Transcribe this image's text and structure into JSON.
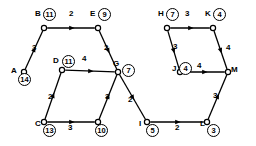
{
  "diagram": {
    "stroke_color": "#000000",
    "background": "#ffffff",
    "nodes": [
      {
        "id": "A",
        "letter": "A",
        "value": "14",
        "x": 24,
        "y": 72,
        "lx": 11,
        "ly": 67,
        "cx": 18,
        "cy": 73
      },
      {
        "id": "B",
        "letter": "B",
        "value": "11",
        "x": 44,
        "y": 28,
        "lx": 35,
        "ly": 10,
        "cx": 43,
        "cy": 8
      },
      {
        "id": "E",
        "letter": "E",
        "value": "9",
        "x": 98,
        "y": 28,
        "lx": 90,
        "ly": 10,
        "cx": 98,
        "cy": 8
      },
      {
        "id": "D",
        "letter": "D",
        "value": "11",
        "x": 62,
        "y": 70,
        "lx": 53,
        "ly": 57,
        "cx": 62,
        "cy": 55
      },
      {
        "id": "G",
        "letter": "G",
        "value": "7",
        "x": 118,
        "y": 72,
        "lx": 113,
        "ly": 60,
        "cx": 122,
        "cy": 64
      },
      {
        "id": "C",
        "letter": "C",
        "value": "13",
        "x": 44,
        "y": 122,
        "lx": 35,
        "ly": 120,
        "cx": 43,
        "cy": 124
      },
      {
        "id": "N10",
        "letter": "",
        "value": "10",
        "x": 98,
        "y": 122,
        "lx": 0,
        "ly": 0,
        "cx": 95,
        "cy": 124
      },
      {
        "id": "I",
        "letter": "I",
        "value": "5",
        "x": 147,
        "y": 122,
        "lx": 139,
        "ly": 120,
        "cx": 146,
        "cy": 124
      },
      {
        "id": "L",
        "letter": "L",
        "value": "3",
        "x": 207,
        "y": 122,
        "lx": 200,
        "ly": 120,
        "cx": 207,
        "cy": 124
      },
      {
        "id": "M",
        "letter": "M",
        "value": "",
        "x": 228,
        "y": 72,
        "lx": 231,
        "ly": 66,
        "cx": 0,
        "cy": 0
      },
      {
        "id": "H",
        "letter": "H",
        "value": "7",
        "x": 167,
        "y": 28,
        "lx": 158,
        "ly": 10,
        "cx": 166,
        "cy": 8
      },
      {
        "id": "K",
        "letter": "K",
        "value": "4",
        "x": 213,
        "y": 28,
        "lx": 205,
        "ly": 10,
        "cx": 213,
        "cy": 8
      },
      {
        "id": "J",
        "letter": "J",
        "value": "4",
        "x": 180,
        "y": 72,
        "lx": 172,
        "ly": 65,
        "cx": 179,
        "cy": 62
      }
    ],
    "edges": [
      {
        "from": "A",
        "to": "B",
        "weight": "3",
        "wx": 32,
        "wy": 44
      },
      {
        "from": "B",
        "to": "E",
        "weight": "2",
        "wx": 69,
        "wy": 10
      },
      {
        "from": "E",
        "to": "G",
        "weight": "2",
        "wx": 104,
        "wy": 44
      },
      {
        "from": "D",
        "to": "G",
        "weight": "4",
        "wx": 82,
        "wy": 55
      },
      {
        "from": "C",
        "to": "D",
        "weight": "2",
        "wx": 48,
        "wy": 93
      },
      {
        "from": "C",
        "to": "N10",
        "weight": "3",
        "wx": 68,
        "wy": 124
      },
      {
        "from": "N10",
        "to": "G",
        "weight": "3",
        "wx": 105,
        "wy": 93
      },
      {
        "from": "G",
        "to": "I",
        "weight": "2",
        "wx": 128,
        "wy": 96
      },
      {
        "from": "I",
        "to": "L",
        "weight": "2",
        "wx": 175,
        "wy": 124
      },
      {
        "from": "L",
        "to": "M",
        "weight": "3",
        "wx": 213,
        "wy": 92
      },
      {
        "from": "J",
        "to": "M",
        "weight": "4",
        "wx": 197,
        "wy": 62
      },
      {
        "from": "H",
        "to": "J",
        "weight": "3",
        "wx": 173,
        "wy": 43
      },
      {
        "from": "H",
        "to": "K",
        "weight": "3",
        "wx": 185,
        "wy": 10
      },
      {
        "from": "K",
        "to": "M",
        "weight": "4",
        "wx": 226,
        "wy": 44
      }
    ]
  }
}
